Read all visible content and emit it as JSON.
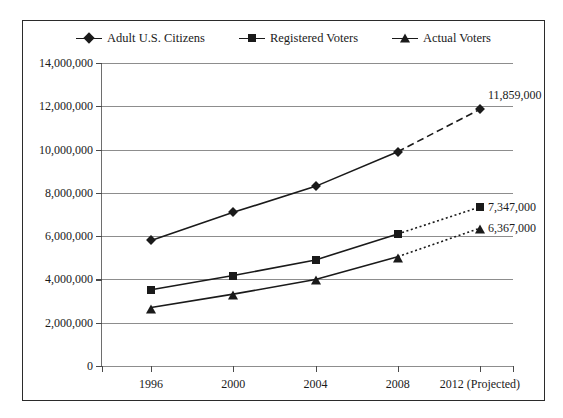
{
  "chart_data": {
    "type": "line",
    "title": "",
    "xlabel": "",
    "ylabel": "",
    "categories": [
      "1996",
      "2000",
      "2004",
      "2008",
      "2012 (Projected)"
    ],
    "ylim": [
      0,
      14000000
    ],
    "ytick_values": [
      0,
      2000000,
      4000000,
      6000000,
      8000000,
      10000000,
      12000000,
      14000000
    ],
    "ytick_labels": [
      "0",
      "2,000,000",
      "4,000,000",
      "6,000,000",
      "8,000,000",
      "10,000,000",
      "12,000,000",
      "14,000,000"
    ],
    "grid": true,
    "legend_position": "top",
    "series": [
      {
        "name": "Adult U.S. Citizens",
        "marker": "diamond",
        "values": [
          5800000,
          7100000,
          8300000,
          9900000,
          11859000
        ],
        "projected_from_index": 3,
        "projected_style": "dashed",
        "end_label": "11,859,000"
      },
      {
        "name": "Registered Voters",
        "marker": "square",
        "values": [
          3520000,
          4180000,
          4900000,
          6100000,
          7347000
        ],
        "projected_from_index": 3,
        "projected_style": "dotted",
        "end_label": "7,347,000"
      },
      {
        "name": "Actual Voters",
        "marker": "triangle",
        "values": [
          2700000,
          3320000,
          4000000,
          5050000,
          6367000
        ],
        "projected_from_index": 3,
        "projected_style": "dotted",
        "end_label": "6,367,000"
      }
    ],
    "annotations": [
      {
        "text": "11,859,000",
        "series": "Adult U.S. Citizens",
        "at": "2012 (Projected)"
      },
      {
        "text": "7,347,000",
        "series": "Registered Voters",
        "at": "2012 (Projected)"
      },
      {
        "text": "6,367,000",
        "series": "Actual Voters",
        "at": "2012 (Projected)"
      }
    ],
    "colors": {
      "line": "#1a1a1a",
      "grid": "#8d8d8d",
      "axis": "#4a4a4a",
      "border": "#2b2b2b",
      "text": "#1a1a1a"
    }
  }
}
